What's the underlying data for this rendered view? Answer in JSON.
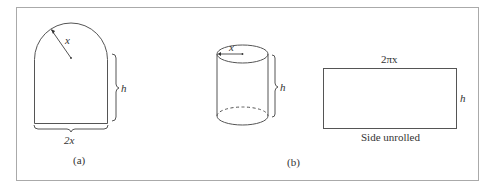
{
  "figure": {
    "panel_a": {
      "radius_label": "x",
      "height_label": "h",
      "width_label": "2x",
      "caption": "(a)"
    },
    "panel_b": {
      "radius_label": "x",
      "height_label": "h",
      "unrolled_width_label": "2πx",
      "unrolled_height_label": "h",
      "unrolled_caption": "Side unrolled",
      "caption": "(b)"
    },
    "colors": {
      "stroke": "#555555",
      "frame": "#999999",
      "text": "#333333"
    }
  }
}
